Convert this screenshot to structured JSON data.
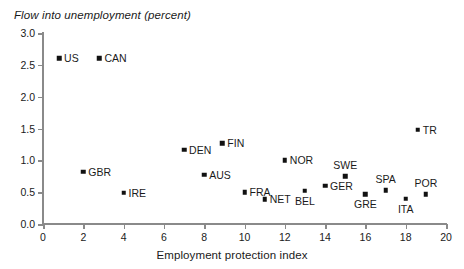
{
  "chart_data": {
    "type": "scatter",
    "title": "Flow into unemployment (percent)",
    "xlabel": "Employment protection index",
    "ylabel": "Flow into unemployment (percent)",
    "xlim": [
      0,
      20
    ],
    "ylim": [
      0,
      3.0
    ],
    "xticks": [
      0,
      2,
      4,
      6,
      8,
      10,
      12,
      14,
      16,
      18,
      20
    ],
    "xtick_labels": [
      "0",
      "2",
      "4",
      "6",
      "8",
      "10",
      "12",
      "14",
      "16",
      "18",
      "20"
    ],
    "yticks": [
      0.0,
      0.5,
      1.0,
      1.5,
      2.0,
      2.5,
      3.0
    ],
    "ytick_labels": [
      "0.0",
      "0.5",
      "1.0",
      "1.5",
      "2.0",
      "2.5",
      "3.0"
    ],
    "grid": false,
    "legend": "none",
    "marker": "square",
    "marker_color": "#111111",
    "axis_color": "#8a8a8a",
    "points": [
      {
        "label": "US",
        "x": 0.8,
        "y": 2.6,
        "label_pos": "right"
      },
      {
        "label": "CAN",
        "x": 2.8,
        "y": 2.6,
        "label_pos": "right"
      },
      {
        "label": "GBR",
        "x": 2.0,
        "y": 0.82,
        "label_pos": "right"
      },
      {
        "label": "IRE",
        "x": 4.0,
        "y": 0.49,
        "label_pos": "right"
      },
      {
        "label": "DEN",
        "x": 7.0,
        "y": 1.17,
        "label_pos": "right"
      },
      {
        "label": "AUS",
        "x": 8.0,
        "y": 0.77,
        "label_pos": "right"
      },
      {
        "label": "FIN",
        "x": 8.9,
        "y": 1.27,
        "label_pos": "right"
      },
      {
        "label": "FRA",
        "x": 10.0,
        "y": 0.5,
        "label_pos": "right"
      },
      {
        "label": "NET",
        "x": 11.0,
        "y": 0.39,
        "label_pos": "right"
      },
      {
        "label": "NOR",
        "x": 12.0,
        "y": 1.0,
        "label_pos": "right"
      },
      {
        "label": "BEL",
        "x": 13.0,
        "y": 0.52,
        "label_pos": "below"
      },
      {
        "label": "GER",
        "x": 14.0,
        "y": 0.6,
        "label_pos": "right"
      },
      {
        "label": "SWE",
        "x": 15.0,
        "y": 0.75,
        "label_pos": "above"
      },
      {
        "label": "GRE",
        "x": 16.0,
        "y": 0.47,
        "label_pos": "below"
      },
      {
        "label": "SPA",
        "x": 17.0,
        "y": 0.53,
        "label_pos": "above"
      },
      {
        "label": "ITA",
        "x": 18.0,
        "y": 0.4,
        "label_pos": "below"
      },
      {
        "label": "TR",
        "x": 18.6,
        "y": 1.48,
        "label_pos": "right"
      },
      {
        "label": "POR",
        "x": 19.0,
        "y": 0.47,
        "label_pos": "above"
      }
    ]
  }
}
